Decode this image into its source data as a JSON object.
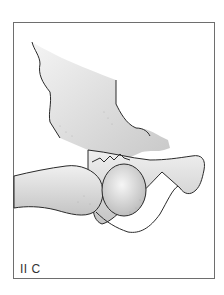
{
  "figure": {
    "label": "II C",
    "colors": {
      "frame": "#6e6e6e",
      "bone_fill": "#e6e6e6",
      "bone_shade": "#b8b8b8",
      "outline": "#2a2a2a",
      "background": "#ffffff"
    }
  }
}
